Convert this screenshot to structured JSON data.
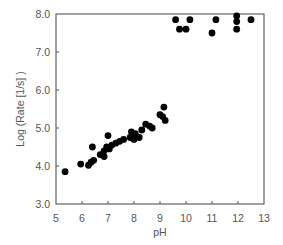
{
  "chart_data": {
    "type": "scatter",
    "title": "",
    "xlabel": "pH",
    "ylabel": "Log (Rate [1/s] )",
    "xlim": [
      5,
      13
    ],
    "ylim": [
      3.0,
      8.0
    ],
    "xticks": [
      "5",
      "6",
      "7",
      "8",
      "9",
      "10",
      "11",
      "12",
      "13"
    ],
    "yticks": [
      "3.0",
      "4.0",
      "5.0",
      "6.0",
      "7.0",
      "8.0"
    ],
    "grid": false,
    "legend": null,
    "marker_color": "#000000",
    "series": [
      {
        "name": "data",
        "points": [
          {
            "x": 5.35,
            "y": 3.85
          },
          {
            "x": 5.95,
            "y": 4.05
          },
          {
            "x": 6.25,
            "y": 4.02
          },
          {
            "x": 6.35,
            "y": 4.1
          },
          {
            "x": 6.4,
            "y": 4.5
          },
          {
            "x": 6.45,
            "y": 4.15
          },
          {
            "x": 6.7,
            "y": 4.3
          },
          {
            "x": 6.85,
            "y": 4.25
          },
          {
            "x": 6.85,
            "y": 4.4
          },
          {
            "x": 6.95,
            "y": 4.5
          },
          {
            "x": 7.0,
            "y": 4.8
          },
          {
            "x": 7.05,
            "y": 4.45
          },
          {
            "x": 7.15,
            "y": 4.55
          },
          {
            "x": 7.3,
            "y": 4.6
          },
          {
            "x": 7.45,
            "y": 4.65
          },
          {
            "x": 7.6,
            "y": 4.7
          },
          {
            "x": 7.85,
            "y": 4.75
          },
          {
            "x": 7.9,
            "y": 4.9
          },
          {
            "x": 8.0,
            "y": 4.7
          },
          {
            "x": 8.05,
            "y": 4.85
          },
          {
            "x": 8.2,
            "y": 4.75
          },
          {
            "x": 8.3,
            "y": 4.95
          },
          {
            "x": 8.45,
            "y": 5.1
          },
          {
            "x": 8.6,
            "y": 5.05
          },
          {
            "x": 8.7,
            "y": 5.0
          },
          {
            "x": 9.0,
            "y": 5.35
          },
          {
            "x": 9.1,
            "y": 5.3
          },
          {
            "x": 9.15,
            "y": 5.55
          },
          {
            "x": 9.2,
            "y": 5.2
          },
          {
            "x": 9.6,
            "y": 7.85
          },
          {
            "x": 9.75,
            "y": 7.6
          },
          {
            "x": 10.0,
            "y": 7.6
          },
          {
            "x": 10.15,
            "y": 7.85
          },
          {
            "x": 11.0,
            "y": 7.5
          },
          {
            "x": 11.15,
            "y": 7.85
          },
          {
            "x": 11.95,
            "y": 7.95
          },
          {
            "x": 11.95,
            "y": 7.8
          },
          {
            "x": 11.95,
            "y": 7.6
          },
          {
            "x": 12.5,
            "y": 7.85
          }
        ]
      }
    ]
  }
}
